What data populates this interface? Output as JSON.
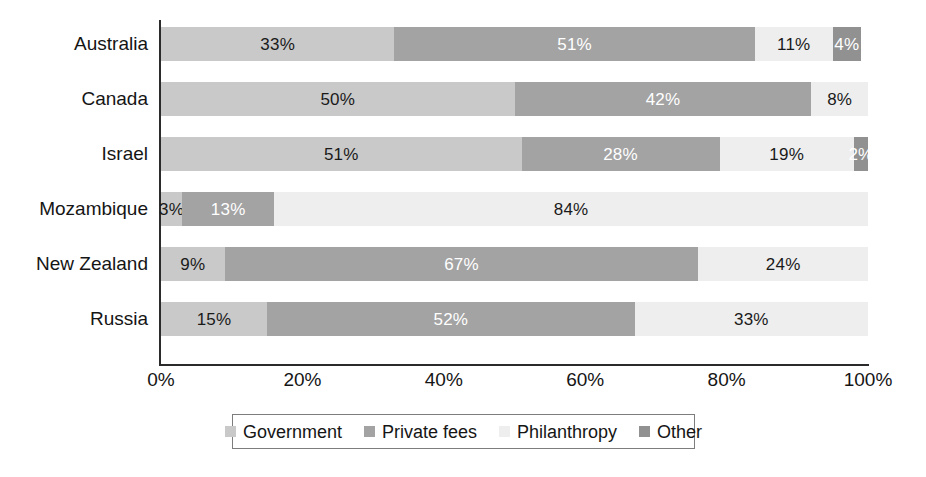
{
  "chart_data": {
    "type": "bar",
    "orientation": "horizontal",
    "stacked": true,
    "stack_total": 100,
    "title": "",
    "subtitle": "",
    "xlabel": "",
    "ylabel": "",
    "xlim": [
      0,
      100
    ],
    "xticks": [
      "0%",
      "20%",
      "40%",
      "60%",
      "80%",
      "100%"
    ],
    "xtick_values": [
      0,
      20,
      40,
      60,
      80,
      100
    ],
    "grid": false,
    "value_suffix": "%",
    "legend_position": "bottom",
    "categories": [
      "Australia",
      "Canada",
      "Israel",
      "Mozambique",
      "New Zealand",
      "Russia"
    ],
    "series": [
      {
        "name": "Government",
        "color": "#c9c9c9",
        "label_color": "#1a1a1a",
        "values": [
          33,
          50,
          51,
          3,
          9,
          15
        ],
        "labels": [
          "33%",
          "50%",
          "51%",
          "3%",
          "9%",
          "15%"
        ]
      },
      {
        "name": "Private fees",
        "color": "#a3a3a3",
        "label_color": "#ffffff",
        "values": [
          51,
          42,
          28,
          13,
          67,
          52
        ],
        "labels": [
          "51%",
          "42%",
          "28%",
          "13%",
          "67%",
          "52%"
        ]
      },
      {
        "name": "Philanthropy",
        "color": "#eeeeee",
        "label_color": "#1a1a1a",
        "values": [
          11,
          8,
          19,
          84,
          24,
          33
        ],
        "labels": [
          "11%",
          "8%",
          "19%",
          "84%",
          "24%",
          "33%"
        ]
      },
      {
        "name": "Other",
        "color": "#919191",
        "label_color": "#ffffff",
        "values": [
          4,
          0,
          2,
          0,
          0,
          0
        ],
        "labels": [
          "4%",
          "",
          "2%",
          "",
          "",
          ""
        ]
      }
    ]
  },
  "legend": {
    "items": [
      {
        "label": "Government",
        "color": "#c9c9c9"
      },
      {
        "label": "Private fees",
        "color": "#a3a3a3"
      },
      {
        "label": "Philanthropy",
        "color": "#eeeeee"
      },
      {
        "label": "Other",
        "color": "#919191"
      }
    ]
  }
}
